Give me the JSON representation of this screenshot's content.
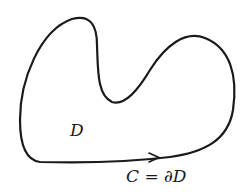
{
  "diagram": {
    "region_label": "D",
    "boundary_label": "C = ∂D",
    "stroke_color": "#1a1a1a",
    "background": "#ffffff",
    "orientation": "counterclockwise",
    "arrow_position": "bottom edge, pointing right"
  }
}
